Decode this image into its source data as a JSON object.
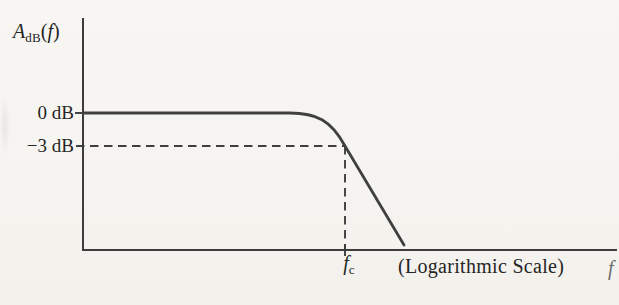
{
  "labels": {
    "y_axis": {
      "main": "A",
      "sub": "dB",
      "open": "(",
      "arg": "f",
      "close": ")"
    },
    "tick_0db": "0 dB",
    "tick_m3db": "−3 dB",
    "fc_main": "f",
    "fc_sub": "c",
    "log_note": "(Logarithmic Scale)",
    "x_axis_label": "f"
  },
  "colors": {
    "paper": "#f5f4f0",
    "ink": "#3c3c3c",
    "text": "#262626"
  },
  "chart_data": {
    "type": "line",
    "title": "",
    "ylabel": "A_dB(f)",
    "xlabel": "f",
    "x_scale": "logarithmic",
    "x_scale_note": "(Logarithmic Scale)",
    "ytick_labels": [
      "0 dB",
      "−3 dB"
    ],
    "xtick_labels": [
      "f_c"
    ],
    "grid": false,
    "legend": "none",
    "key_points": [
      {
        "x": "f ≪ f_c",
        "y_db": 0
      },
      {
        "x": "f_c",
        "y_db": -3
      },
      {
        "x": "f > f_c",
        "y_db": "steep roll-off to axis"
      }
    ],
    "render": {
      "paths": {
        "axes": "M 83 19 L 83 250 L 616 250",
        "curve": "M 83 113 L 290 113 C 316 113 331 120 345 146 L 404 245",
        "dash_h": "M 76 146 L 345 146",
        "dash_v": "M 345 146 L 345 250",
        "tick_0db": "M 75 113 L 84 113",
        "tick_fc": "M 345 244 L 345 256"
      }
    }
  }
}
